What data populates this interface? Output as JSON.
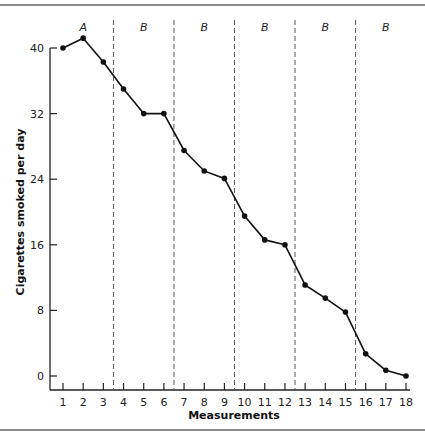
{
  "chart_data": {
    "type": "line",
    "title": "",
    "xlabel": "Measurements",
    "ylabel": "Cigarettes smoked per day",
    "x": [
      1,
      2,
      3,
      4,
      5,
      6,
      7,
      8,
      9,
      10,
      11,
      12,
      13,
      14,
      15,
      16,
      17,
      18
    ],
    "x_tick_labels": [
      "1",
      "2",
      "3",
      "4",
      "5",
      "6",
      "7",
      "8",
      "9",
      "10",
      "11",
      "12",
      "13",
      "14",
      "15",
      "16",
      "17",
      "18"
    ],
    "y_ticks": [
      0,
      8,
      16,
      24,
      32,
      40
    ],
    "y_tick_labels": [
      "0",
      "8",
      "16",
      "24",
      "32",
      "40"
    ],
    "ylim": [
      0,
      42
    ],
    "xlim": [
      0.5,
      18.5
    ],
    "grid": false,
    "legend": null,
    "series": [
      {
        "name": "Cigarettes smoked per day",
        "values": [
          40,
          41.2,
          38.3,
          35,
          32,
          32,
          27.5,
          25,
          24.1,
          19.5,
          16.6,
          16,
          11.1,
          9.5,
          7.8,
          2.7,
          0.7,
          0
        ]
      }
    ],
    "phase_lines_after_x": [
      3.5,
      6.5,
      9.5,
      12.5,
      15.5
    ],
    "phases": [
      {
        "label": "A",
        "from": 1,
        "to": 3
      },
      {
        "label": "B",
        "from": 4,
        "to": 6
      },
      {
        "label": "B",
        "from": 7,
        "to": 9
      },
      {
        "label": "B",
        "from": 10,
        "to": 12
      },
      {
        "label": "B",
        "from": 13,
        "to": 15
      },
      {
        "label": "B",
        "from": 16,
        "to": 18
      }
    ],
    "colors": {
      "line": "#111111",
      "marker": "#111111",
      "phase_line": "#555555",
      "axis": "#222222"
    }
  }
}
